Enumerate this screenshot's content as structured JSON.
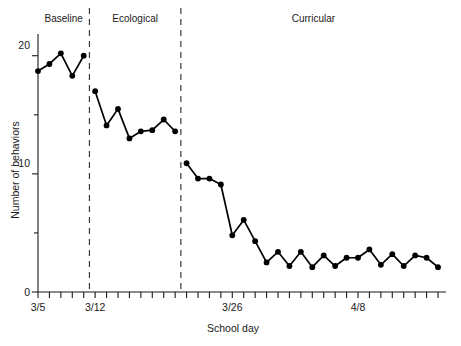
{
  "chart_data": {
    "type": "line",
    "title": "",
    "xlabel": "School day",
    "ylabel": "Number of behaviors",
    "ylim": [
      0,
      21.5
    ],
    "yticks_major": [
      0,
      10,
      20
    ],
    "yticks_minor": [
      5,
      15
    ],
    "ytick_labels": [
      "0",
      "10",
      "20"
    ],
    "xtick_labels": [
      "3/5",
      "3/12",
      "3/26",
      "4/8"
    ],
    "xtick_label_days": [
      1,
      6,
      18,
      29
    ],
    "grid": false,
    "legend": "none",
    "n_days": 36,
    "x": [
      1,
      2,
      3,
      4,
      5,
      6,
      7,
      8,
      9,
      10,
      11,
      12,
      13,
      14,
      15,
      16,
      17,
      18,
      19,
      20,
      21,
      22,
      23,
      24,
      25,
      26,
      27,
      28,
      29,
      30,
      31,
      32,
      33,
      34,
      35,
      36
    ],
    "values": [
      18.7,
      19.3,
      20.2,
      18.3,
      20.0,
      17.0,
      14.1,
      15.5,
      13.0,
      13.6,
      13.7,
      14.6,
      13.6,
      10.9,
      9.6,
      9.6,
      9.1,
      4.8,
      6.1,
      4.3,
      2.5,
      3.4,
      2.2,
      3.4,
      2.1,
      3.1,
      2.2,
      2.9,
      2.9,
      3.6,
      2.3,
      3.2,
      2.2,
      3.1,
      2.9,
      2.1
    ],
    "annotations": [
      {
        "label": "Baseline",
        "start_day": 1,
        "end_day": 5
      },
      {
        "label": "Ecological",
        "start_day": 6,
        "end_day": 13
      },
      {
        "label": "Curricular",
        "start_day": 14,
        "end_day": 36
      }
    ],
    "phase_dividers_after_day": [
      5,
      13
    ],
    "series_color": "#000000",
    "marker": "filled-circle"
  },
  "axis": {
    "y_title": "Number of behaviors",
    "x_title": "School day",
    "y_label_0": "0",
    "y_label_10": "10",
    "y_label_20": "20",
    "x_label_1": "3/5",
    "x_label_2": "3/12",
    "x_label_3": "3/26",
    "x_label_4": "4/8"
  },
  "phases": {
    "baseline": "Baseline",
    "ecological": "Ecological",
    "curricular": "Curricular"
  },
  "colors": {
    "ink": "#000000",
    "axis": "#1a1a1a",
    "divider": "#3a3a3a",
    "background": "#ffffff"
  }
}
